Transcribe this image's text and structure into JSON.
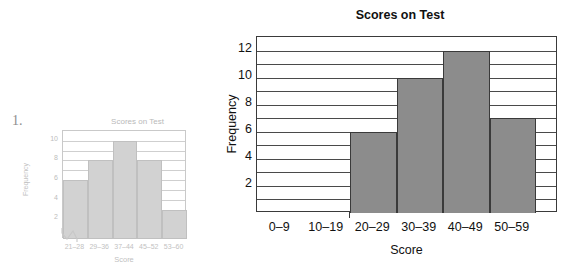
{
  "problem": {
    "number": "1."
  },
  "chart_data": [
    {
      "id": "small",
      "type": "bar",
      "title": "Scores on Test",
      "xlabel": "Score",
      "ylabel": "Frequency",
      "categories": [
        "21–28",
        "29–36",
        "37–44",
        "45–52",
        "53–60"
      ],
      "values": [
        6,
        8,
        10,
        8,
        3
      ],
      "ytick_labels": [
        "2",
        "4",
        "6",
        "8",
        "10"
      ],
      "yticks": [
        2,
        4,
        6,
        8,
        10
      ],
      "ylim": [
        0,
        11
      ],
      "grid": true,
      "grid_step": 1,
      "axis_break": true,
      "legend": "none",
      "bar_color": "#d2d2d2",
      "line_color": "#c0c0c0",
      "text_color": "#bdbdbd"
    },
    {
      "id": "large",
      "type": "bar",
      "title": "Scores on Test",
      "xlabel": "Score",
      "ylabel": "Frequency",
      "categories": [
        "0–9",
        "10–19",
        "20–29",
        "30–39",
        "40–49",
        "50–59"
      ],
      "values": [
        0,
        0,
        6,
        10,
        12,
        7
      ],
      "ytick_labels": [
        "2",
        "4",
        "6",
        "8",
        "10",
        "12"
      ],
      "yticks": [
        2,
        4,
        6,
        8,
        10,
        12
      ],
      "ylim": [
        0,
        13
      ],
      "grid": true,
      "grid_step": 1,
      "axis_break": false,
      "legend": "none",
      "bar_color": "#8c8c8c",
      "line_color": "#3a3a3a",
      "text_color": "#111111"
    }
  ]
}
